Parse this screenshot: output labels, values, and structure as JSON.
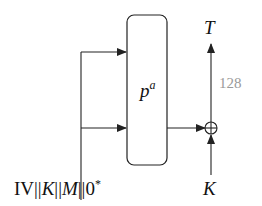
{
  "diagram": {
    "permutation": {
      "label": "p",
      "superscript": "a"
    },
    "output": {
      "label": "T"
    },
    "key_input": {
      "label": "K"
    },
    "width_label": {
      "text": "128",
      "color": "#9a9a9a"
    },
    "input_label": {
      "parts": [
        "IV",
        "||",
        "K",
        "||",
        "M",
        "||",
        "0",
        "*"
      ]
    },
    "colors": {
      "stroke": "#222222",
      "background": "#ffffff"
    }
  }
}
